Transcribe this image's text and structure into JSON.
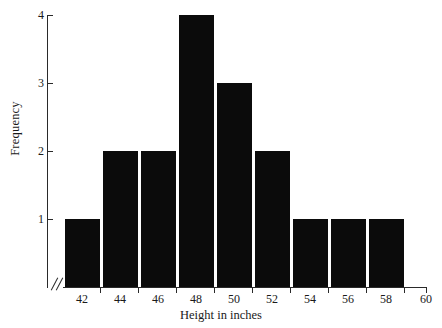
{
  "chart_data": {
    "type": "bar",
    "title": "",
    "subtitle": "",
    "xlabel": "Height in inches",
    "ylabel": "Frequency",
    "categories": [
      "42",
      "44",
      "46",
      "48",
      "50",
      "52",
      "54",
      "56",
      "58"
    ],
    "values": [
      1,
      2,
      2,
      4,
      3,
      2,
      1,
      1,
      1
    ],
    "xtick_labels": [
      "42",
      "44",
      "46",
      "48",
      "50",
      "52",
      "54",
      "56",
      "58",
      "60"
    ],
    "ytick_labels": [
      "1",
      "2",
      "3",
      "4"
    ],
    "xlim": [
      41,
      60
    ],
    "ylim": [
      0,
      4
    ],
    "grid": false,
    "legend": null,
    "bar_color": "#0b0b0b",
    "axis_color": "#2a2a2a",
    "axis_break": "//"
  },
  "figure": {
    "background": "#ffffff",
    "text_color": "#1a1a1a"
  }
}
